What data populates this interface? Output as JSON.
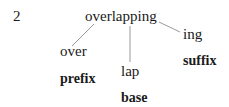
{
  "example_number": "2",
  "word": "overlapping",
  "morphemes": [
    {
      "form": "over",
      "label": "prefix"
    },
    {
      "form": "lap",
      "label": "base"
    },
    {
      "form": "ing",
      "label": "suffix"
    }
  ]
}
